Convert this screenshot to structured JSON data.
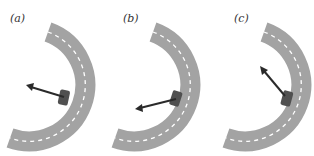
{
  "figure": {
    "panels": [
      {
        "label": "(a)",
        "arrow_direction": "up-left (toward center, slightly upward)"
      },
      {
        "label": "(b)",
        "arrow_direction": "left-down"
      },
      {
        "label": "(c)",
        "arrow_direction": "up-left (steep)"
      }
    ],
    "colors": {
      "road": "#a3a3a3",
      "lane_marking": "#ffffff",
      "car": "#505050",
      "arrow": "#2a2a2a",
      "background": "#ffffff"
    }
  }
}
